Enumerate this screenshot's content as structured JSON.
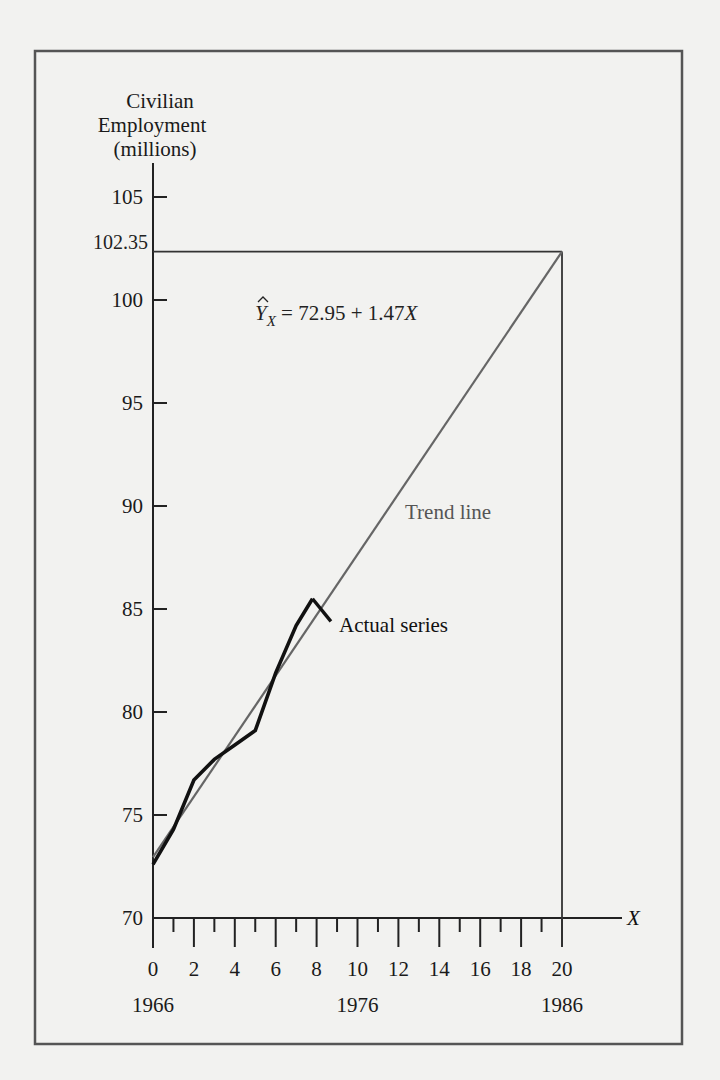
{
  "chart_data": {
    "type": "line",
    "title": "",
    "ylabel": [
      "Civilian",
      "Employment",
      "(millions)"
    ],
    "xlabel": "X",
    "ylim": [
      70,
      106.5
    ],
    "xlim": [
      0,
      23
    ],
    "grid": false,
    "y_ticks": [
      70,
      75,
      80,
      85,
      90,
      95,
      100,
      105
    ],
    "y_reference": {
      "value": 102.35,
      "label": "102.35"
    },
    "x_ticks_major": [
      0,
      2,
      4,
      6,
      8,
      10,
      12,
      14,
      16,
      18,
      20
    ],
    "x_ticks_minor": [
      1,
      3,
      5,
      7,
      9,
      11,
      13,
      15,
      17,
      19
    ],
    "year_labels": [
      {
        "x": 0,
        "label": "1966"
      },
      {
        "x": 10,
        "label": "1976"
      },
      {
        "x": 20,
        "label": "1986"
      }
    ],
    "series": [
      {
        "name": "Trend line",
        "color": "#666666",
        "equation": "72.95 + 1.47X",
        "intercept": 72.95,
        "slope": 1.47,
        "x": [
          0,
          20
        ],
        "values": [
          72.95,
          102.35
        ]
      },
      {
        "name": "Actual series",
        "color": "#111111",
        "x": [
          0,
          1,
          2,
          3,
          4,
          5,
          6,
          7,
          7.8
        ],
        "values": [
          72.6,
          74.3,
          76.7,
          77.7,
          78.4,
          79.1,
          81.9,
          84.2,
          85.5
        ]
      }
    ],
    "annotations": [
      {
        "text": "Trend line",
        "x": 12.3,
        "y": 89.8,
        "color": "#555555"
      },
      {
        "text": "Actual series",
        "x": 9.0,
        "y": 84.2,
        "color": "#111111"
      },
      {
        "text": "Ŷ_X = 72.95 + 1.47X",
        "x": 5.0,
        "y": 99.6
      }
    ]
  },
  "labels": {
    "y_title_1": "Civilian",
    "y_title_2": "Employment",
    "y_title_3": "(millions)",
    "equation_y": "Y",
    "equation_sub": "X",
    "equation_rhs": " = 72.95 + 1.47",
    "equation_x": "X",
    "trend_label": "Trend line",
    "actual_label": "Actual series",
    "x_axis_label": "X",
    "ref_label": "102.35"
  }
}
